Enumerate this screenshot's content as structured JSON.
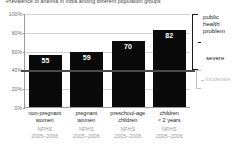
{
  "chart_data": {
    "type": "bar",
    "title": "Prevalence of anemia in India among different population groups",
    "xlabel": "",
    "ylabel": "",
    "ylim": [
      0,
      100
    ],
    "grid": true,
    "legend_position": "right",
    "categories": [
      "non-pregnant women",
      "pregnant women",
      "preschool-age children",
      "children < 2 years"
    ],
    "values": [
      55,
      59,
      70,
      82
    ],
    "bars": [
      {
        "group_line1": "non-pregnant",
        "group_line2": "women",
        "source": "NFHS",
        "years": "2005–2006",
        "value": 55,
        "label": "55"
      },
      {
        "group_line1": "pregnant",
        "group_line2": "women",
        "source": "NFHS",
        "years": "2005–2006",
        "value": 59,
        "label": "59"
      },
      {
        "group_line1": "preschool-age",
        "group_line2": "children",
        "source": "NFHS",
        "years": "2005–2006",
        "value": 70,
        "label": "70"
      },
      {
        "group_line1": "children",
        "group_line2": "< 2 years",
        "source": "NFHS",
        "years": "2005–2006",
        "value": 82,
        "label": "82"
      }
    ],
    "y_ticks": [
      "100%",
      "80%",
      "60%",
      "40%",
      "20%",
      "0%"
    ],
    "y_tick_values": [
      100,
      80,
      60,
      40,
      20,
      0
    ],
    "annotations": {
      "public_health_problem": "public health problem",
      "public_health_problem_lines": [
        "public",
        "health",
        "problem"
      ],
      "severe": "severe",
      "moderate": "moderate",
      "severe_range": [
        40,
        100
      ],
      "moderate_range": [
        20,
        40
      ],
      "threshold_value": 40
    },
    "colors": {
      "bar": "#0a0a0a",
      "bar_value_text": "#ffffff",
      "grid": "#d2d2d2",
      "axis": "#9a9a9a",
      "severe_bracket": "#1a1a1a",
      "moderate_bracket": "#c2c2c2",
      "moderate_text": "#bdbdbd",
      "source_text": "#989898",
      "background": "#ffffff"
    }
  }
}
